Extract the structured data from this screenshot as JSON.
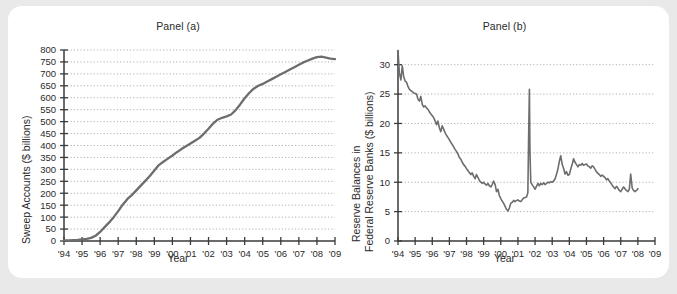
{
  "figure": {
    "background_color": "#e9e9e9",
    "card_color": "#ffffff",
    "line_color": "#6d6d6d",
    "grid_color": "#a8a8a8",
    "axis_color": "#3b3b3b",
    "text_color": "#2a2a2a"
  },
  "panel_a": {
    "title": "Panel (a)",
    "xlabel": "Year",
    "ylabel": "Sweep Accounts ($ billions)"
  },
  "panel_b": {
    "title": "Panel (b)",
    "xlabel": "Year",
    "ylabel_line1": "Reserve Balances in",
    "ylabel_line2": "Federal Reserve Banks ($ billions)"
  },
  "chart_data": [
    {
      "type": "line",
      "title": "Panel (a)",
      "xlabel": "Year",
      "ylabel": "Sweep Accounts ($ billions)",
      "xlim": [
        1994,
        2009
      ],
      "ylim": [
        0,
        800
      ],
      "yticks": [
        0,
        50,
        100,
        150,
        200,
        250,
        300,
        350,
        400,
        450,
        500,
        550,
        600,
        650,
        700,
        750,
        800
      ],
      "xticks": [
        1994,
        1995,
        1996,
        1997,
        1998,
        1999,
        2000,
        2001,
        2002,
        2003,
        2004,
        2005,
        2006,
        2007,
        2008,
        2009
      ],
      "xticklabels": [
        "'94",
        "'95",
        "'96",
        "'97",
        "'98",
        "'99",
        "'00",
        "'01",
        "'02",
        "'03",
        "'04",
        "'05",
        "'06",
        "'07",
        "'08",
        "'09"
      ],
      "grid": true,
      "legend": "none",
      "series": [
        {
          "name": "Sweep Accounts",
          "x": [
            1994.0,
            1994.25,
            1994.5,
            1994.75,
            1995.0,
            1995.25,
            1995.5,
            1995.75,
            1996.0,
            1996.25,
            1996.5,
            1996.75,
            1997.0,
            1997.25,
            1997.5,
            1997.75,
            1998.0,
            1998.25,
            1998.5,
            1998.75,
            1999.0,
            1999.25,
            1999.5,
            1999.75,
            2000.0,
            2000.25,
            2000.5,
            2000.75,
            2001.0,
            2001.25,
            2001.5,
            2001.75,
            2002.0,
            2002.25,
            2002.5,
            2002.75,
            2003.0,
            2003.25,
            2003.5,
            2003.75,
            2004.0,
            2004.25,
            2004.5,
            2004.75,
            2005.0,
            2005.25,
            2005.5,
            2005.75,
            2006.0,
            2006.25,
            2006.5,
            2006.75,
            2007.0,
            2007.25,
            2007.5,
            2007.75,
            2008.0,
            2008.25,
            2008.5,
            2008.75,
            2009.0
          ],
          "y": [
            3,
            3,
            4,
            5,
            7,
            9,
            13,
            22,
            38,
            58,
            78,
            100,
            125,
            152,
            175,
            192,
            212,
            232,
            252,
            272,
            295,
            318,
            332,
            345,
            358,
            372,
            385,
            397,
            408,
            420,
            432,
            450,
            470,
            492,
            508,
            516,
            522,
            530,
            548,
            572,
            598,
            620,
            638,
            650,
            658,
            668,
            678,
            688,
            698,
            708,
            718,
            728,
            738,
            748,
            756,
            764,
            770,
            772,
            768,
            764,
            762
          ]
        }
      ]
    },
    {
      "type": "line",
      "title": "Panel (b)",
      "xlabel": "Year",
      "ylabel": "Reserve Balances in Federal Reserve Banks ($ billions)",
      "xlim": [
        1994,
        2009
      ],
      "ylim": [
        0,
        32.5
      ],
      "yticks": [
        0,
        5,
        10,
        15,
        20,
        25,
        30
      ],
      "xticks": [
        1994,
        1995,
        1996,
        1997,
        1998,
        1999,
        2000,
        2001,
        2002,
        2003,
        2004,
        2005,
        2006,
        2007,
        2008,
        2009
      ],
      "xticklabels": [
        "'94",
        "'95",
        "'96",
        "'97",
        "'98",
        "'99",
        "'00",
        "'01",
        "'02",
        "'03",
        "'04",
        "'05",
        "'06",
        "'07",
        "'08",
        "'09"
      ],
      "grid": true,
      "legend": "none",
      "annotations": [
        {
          "label": "Sept 2001 spike",
          "x": 2001.7,
          "y": 25.8
        }
      ],
      "series": [
        {
          "name": "Reserve Balances",
          "x": [
            1994.0,
            1994.08,
            1994.17,
            1994.25,
            1994.33,
            1994.42,
            1994.5,
            1994.58,
            1994.67,
            1994.75,
            1994.83,
            1994.92,
            1995.0,
            1995.08,
            1995.17,
            1995.25,
            1995.33,
            1995.42,
            1995.5,
            1995.58,
            1995.67,
            1995.75,
            1995.83,
            1995.92,
            1996.0,
            1996.08,
            1996.17,
            1996.25,
            1996.33,
            1996.42,
            1996.5,
            1996.58,
            1996.67,
            1996.75,
            1996.83,
            1996.92,
            1997.0,
            1997.08,
            1997.17,
            1997.25,
            1997.33,
            1997.42,
            1997.5,
            1997.58,
            1997.67,
            1997.75,
            1997.83,
            1997.92,
            1998.0,
            1998.08,
            1998.17,
            1998.25,
            1998.33,
            1998.42,
            1998.5,
            1998.58,
            1998.67,
            1998.75,
            1998.83,
            1998.92,
            1999.0,
            1999.08,
            1999.17,
            1999.25,
            1999.33,
            1999.42,
            1999.5,
            1999.58,
            1999.67,
            1999.75,
            1999.83,
            1999.92,
            2000.0,
            2000.08,
            2000.17,
            2000.25,
            2000.33,
            2000.42,
            2000.5,
            2000.58,
            2000.67,
            2000.75,
            2000.83,
            2000.92,
            2001.0,
            2001.08,
            2001.17,
            2001.25,
            2001.33,
            2001.42,
            2001.5,
            2001.58,
            2001.62,
            2001.67,
            2001.7,
            2001.75,
            2001.83,
            2001.92,
            2002.0,
            2002.08,
            2002.17,
            2002.25,
            2002.33,
            2002.42,
            2002.5,
            2002.58,
            2002.67,
            2002.75,
            2002.83,
            2002.92,
            2003.0,
            2003.08,
            2003.17,
            2003.25,
            2003.33,
            2003.42,
            2003.5,
            2003.58,
            2003.67,
            2003.75,
            2003.83,
            2003.92,
            2004.0,
            2004.08,
            2004.17,
            2004.25,
            2004.33,
            2004.42,
            2004.5,
            2004.58,
            2004.67,
            2004.75,
            2004.83,
            2004.92,
            2005.0,
            2005.08,
            2005.17,
            2005.25,
            2005.33,
            2005.42,
            2005.5,
            2005.58,
            2005.67,
            2005.75,
            2005.83,
            2005.92,
            2006.0,
            2006.08,
            2006.17,
            2006.25,
            2006.33,
            2006.42,
            2006.5,
            2006.58,
            2006.67,
            2006.75,
            2006.83,
            2006.92,
            2007.0,
            2007.08,
            2007.17,
            2007.25,
            2007.33,
            2007.42,
            2007.5,
            2007.58,
            2007.67,
            2007.75,
            2007.83,
            2007.92,
            2008.0
          ],
          "y": [
            32.4,
            28.6,
            27.4,
            29.8,
            28.0,
            27.2,
            27.0,
            26.3,
            25.8,
            25.6,
            25.4,
            25.2,
            25.1,
            25.0,
            24.1,
            23.8,
            24.6,
            23.2,
            22.8,
            23.0,
            22.6,
            22.4,
            22.0,
            21.6,
            21.3,
            21.0,
            20.4,
            19.8,
            20.4,
            19.2,
            18.6,
            19.6,
            19.0,
            18.4,
            18.0,
            17.6,
            17.2,
            16.8,
            16.4,
            16.0,
            15.6,
            15.2,
            14.8,
            14.2,
            13.9,
            13.4,
            13.0,
            12.7,
            12.3,
            12.0,
            11.6,
            11.3,
            11.6,
            11.0,
            10.6,
            11.3,
            10.8,
            10.3,
            10.0,
            9.8,
            10.0,
            9.7,
            9.5,
            9.8,
            9.4,
            9.2,
            9.6,
            10.2,
            9.6,
            8.4,
            8.8,
            7.7,
            7.2,
            6.8,
            6.4,
            5.9,
            5.4,
            5.1,
            5.6,
            6.4,
            6.6,
            6.9,
            6.7,
            6.9,
            7.0,
            6.8,
            6.7,
            7.0,
            7.3,
            7.4,
            7.5,
            8.2,
            17.0,
            25.8,
            15.5,
            10.0,
            9.6,
            9.2,
            8.8,
            9.3,
            9.8,
            9.4,
            9.8,
            9.6,
            9.9,
            9.6,
            9.8,
            10.0,
            9.9,
            10.1,
            10.0,
            10.2,
            10.6,
            11.3,
            12.2,
            13.6,
            14.5,
            13.1,
            12.3,
            11.4,
            11.8,
            11.2,
            11.3,
            12.2,
            13.1,
            14.0,
            13.4,
            13.0,
            12.6,
            13.0,
            12.9,
            13.2,
            12.9,
            13.0,
            13.1,
            12.8,
            12.6,
            12.4,
            12.8,
            12.6,
            12.2,
            11.8,
            11.5,
            11.3,
            11.0,
            11.2,
            11.0,
            10.8,
            10.4,
            10.6,
            10.2,
            9.9,
            9.5,
            9.2,
            8.9,
            9.3,
            9.0,
            8.6,
            8.4,
            8.8,
            9.2,
            8.9,
            8.6,
            8.4,
            8.8,
            11.4,
            9.0,
            8.6,
            8.4,
            8.6,
            8.9
          ]
        }
      ]
    }
  ]
}
